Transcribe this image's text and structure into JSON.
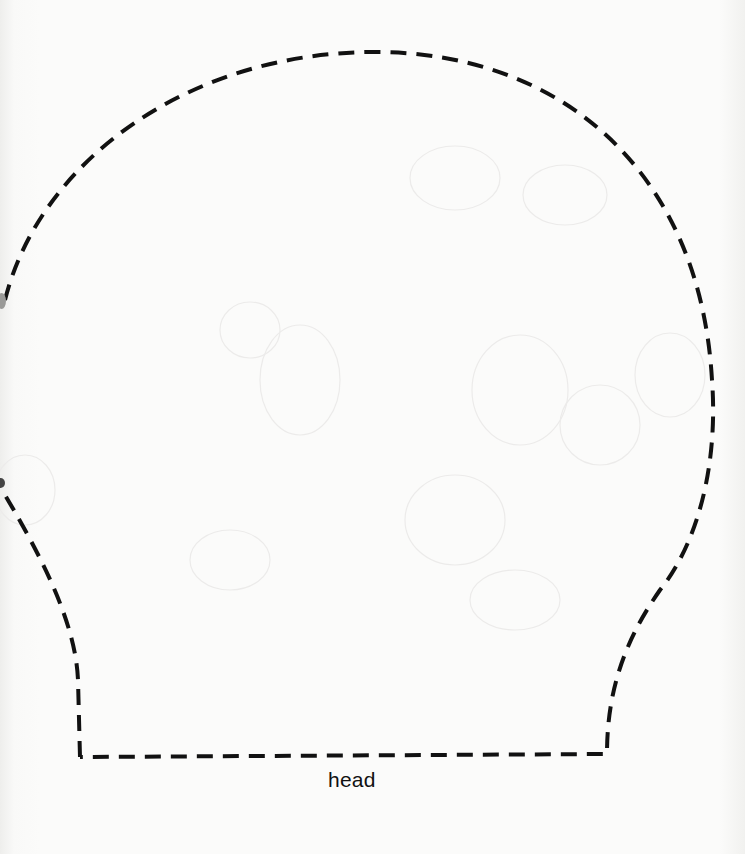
{
  "template": {
    "label": "head",
    "shape": "dome-shaped head pattern with flared base",
    "line_style": "dashed cut line",
    "line_color": "#111111",
    "background_color": "#fbfbfa"
  }
}
